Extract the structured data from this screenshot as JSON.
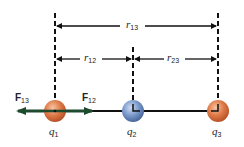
{
  "diagram": {
    "type": "coulomb-three-charges",
    "colors": {
      "line": "#111111",
      "force_arrow": "#1e4a2e",
      "charge_positive": "#d9703f",
      "charge_negative": "#6e8fc4"
    },
    "charges": [
      {
        "id": "q1",
        "symbol": "q",
        "subscript": "1",
        "color": "#d9703f"
      },
      {
        "id": "q2",
        "symbol": "q",
        "subscript": "2",
        "color": "#6e8fc4"
      },
      {
        "id": "q3",
        "symbol": "q",
        "subscript": "3",
        "color": "#d9703f"
      }
    ],
    "distances": [
      {
        "id": "r13",
        "symbol": "r",
        "subscript": "13"
      },
      {
        "id": "r12",
        "symbol": "r",
        "subscript": "12"
      },
      {
        "id": "r23",
        "symbol": "r",
        "subscript": "23"
      }
    ],
    "forces": [
      {
        "id": "F13",
        "symbol": "F",
        "subscript": "13",
        "direction": "left"
      },
      {
        "id": "F12",
        "symbol": "F",
        "subscript": "12",
        "direction": "right"
      }
    ]
  }
}
